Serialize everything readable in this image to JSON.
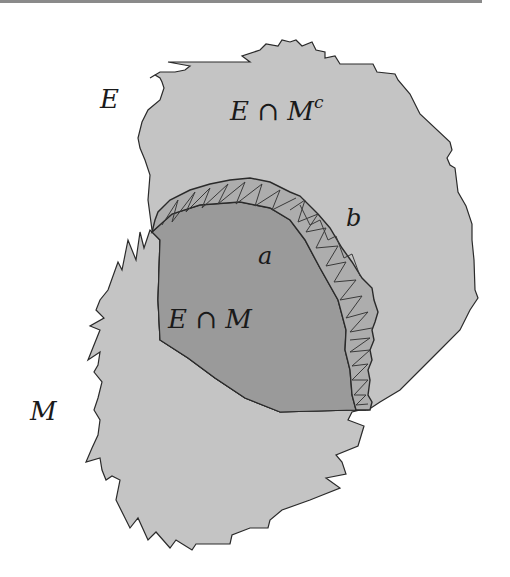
{
  "diagram": {
    "regions": [
      {
        "id": "E",
        "description": "set E (upper region)",
        "color": "#c4c4c4"
      },
      {
        "id": "M",
        "description": "set M (lower-left region)",
        "color": "#c4c4c4"
      },
      {
        "id": "E_cap_M",
        "description": "intersection region",
        "color": "#9a9a9a"
      },
      {
        "id": "boundary_band",
        "description": "hatched band along boundary between a and b",
        "color": "#a8a8a8"
      }
    ],
    "colors": {
      "light_fill": "#c4c4c4",
      "dark_fill": "#9a9a9a",
      "band_fill": "#adadad",
      "stroke": "#2a2a2a",
      "background": "#ffffff"
    },
    "labels": {
      "E": "E",
      "M": "M",
      "E_cap_Mc_base": "E ∩ M",
      "E_cap_Mc_sup": "c",
      "E_cap_M": "E ∩ M",
      "a": "a",
      "b": "b"
    }
  }
}
